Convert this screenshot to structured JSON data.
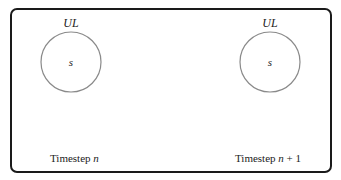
{
  "diagram": {
    "colors": {
      "frame": "#1a1a1a",
      "circle": "#8a8a8a",
      "text": "#222222",
      "background": "#ffffff"
    },
    "panels": [
      {
        "set_label": "UL",
        "state_label": "s",
        "timestep_prefix": "Timestep ",
        "timestep_var": "n",
        "timestep_suffix": ""
      },
      {
        "set_label": "UL",
        "state_label": "s",
        "timestep_prefix": "Timestep ",
        "timestep_var": "n",
        "timestep_suffix": " + 1"
      }
    ]
  }
}
